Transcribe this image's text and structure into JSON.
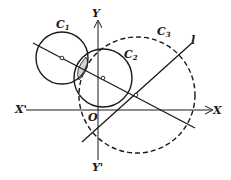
{
  "figure": {
    "type": "geometry-diagram",
    "labels": {
      "c1": {
        "main": "C",
        "sub": "1"
      },
      "c2": {
        "main": "C",
        "sub": "2"
      },
      "c3": {
        "main": "C",
        "sub": "3"
      },
      "line_l": "l",
      "x_axis_pos": "X",
      "x_axis_neg": "X'",
      "y_axis_pos": "Y",
      "y_axis_neg": "Y'",
      "origin": "O"
    },
    "elements": {
      "circle_c1": {
        "style": "solid",
        "cx": 62,
        "cy": 58,
        "r": 26
      },
      "circle_c2": {
        "style": "solid",
        "cx": 103,
        "cy": 78,
        "r": 29
      },
      "circle_c3": {
        "style": "dashed",
        "cx": 137,
        "cy": 95,
        "r": 58
      },
      "line_centers": {
        "note": "line through centers of C1 and C2"
      },
      "line_l": {
        "note": "line l crossing C3"
      }
    },
    "colors": {
      "ink": "#1a1a1a",
      "background": "#ffffff"
    }
  }
}
